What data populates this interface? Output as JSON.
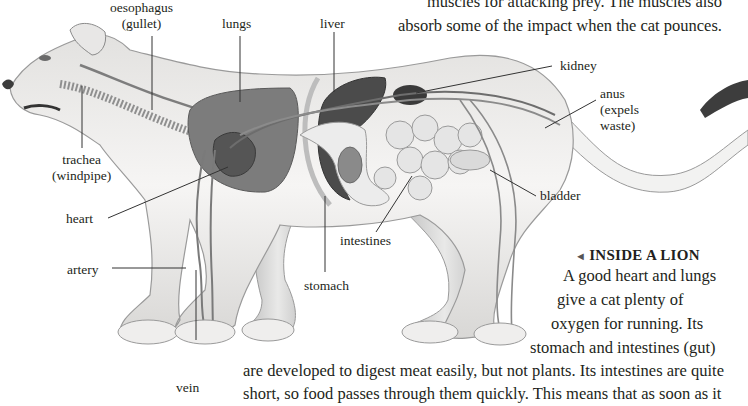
{
  "intro_text": {
    "line1": "muscles for attacking prey. The muscles also",
    "line2": "absorb some of the impact when the cat pounces."
  },
  "labels": {
    "oesophagus": {
      "line1": "oesophagus",
      "line2": "(gullet)"
    },
    "lungs": "lungs",
    "liver": "liver",
    "kidney": "kidney",
    "anus": {
      "line1": "anus",
      "line2": "(expels",
      "line3": "waste)"
    },
    "trachea": {
      "line1": "trachea",
      "line2": "(windpipe)"
    },
    "heart": "heart",
    "bladder": "bladder",
    "intestines": "intestines",
    "artery": "artery",
    "stomach": "stomach",
    "vein": "vein"
  },
  "caption": {
    "arrow": "◄",
    "heading": "INSIDE A LION",
    "lines": [
      "A good heart and lungs",
      "give a cat plenty of",
      "oxygen for running. Its",
      "stomach and intestines (gut)",
      "are developed to digest meat easily, but not plants. Its intestines are quite",
      "short, so food passes through them quickly. This means that as soon as it"
    ]
  },
  "colors": {
    "text": "#231f20",
    "body_fill": "#f1f0ef",
    "body_stroke": "#9a9a9a",
    "organ_dark": "#4f4f4f",
    "organ_mid": "#7a7a7a",
    "organ_light": "#dcdcdc",
    "leader_line": "#333333"
  }
}
